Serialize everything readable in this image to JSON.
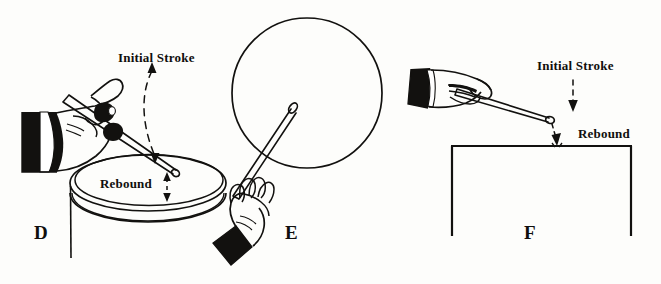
{
  "figure": {
    "background_color": "#fdfdfb",
    "ink_color": "#12110f"
  },
  "panels": [
    {
      "id": "D",
      "label": "D",
      "subject": "hand holding drumstick striking a drum head",
      "callouts": [
        {
          "name": "initial-stroke",
          "text": "Initial Stroke"
        },
        {
          "name": "rebound",
          "text": "Rebound"
        }
      ],
      "icons": [
        "hand-icon",
        "drumstick-icon",
        "drum-icon",
        "curved-dashed-arrow-icon",
        "rebound-dashed-arrow-icon"
      ]
    },
    {
      "id": "E",
      "label": "E",
      "subject": "hand holding drumstick raised toward a round drum head",
      "callouts": [],
      "icons": [
        "hand-icon",
        "drumstick-icon",
        "drum-circle-icon"
      ]
    },
    {
      "id": "F",
      "label": "F",
      "subject": "hand holding drumstick over a practice pad or table edge",
      "callouts": [
        {
          "name": "initial-stroke",
          "text": "Initial Stroke"
        },
        {
          "name": "rebound",
          "text": "Rebound"
        }
      ],
      "icons": [
        "hand-icon",
        "drumstick-icon",
        "table-icon",
        "stroke-dashed-arrow-icon",
        "rebound-dashed-arrow-icon"
      ]
    }
  ],
  "labels": {
    "panel_d": "D",
    "panel_e": "E",
    "panel_f": "F",
    "d_initial_stroke": "Initial Stroke",
    "d_rebound": "Rebound",
    "f_initial_stroke": "Initial Stroke",
    "f_rebound": "Rebound"
  }
}
